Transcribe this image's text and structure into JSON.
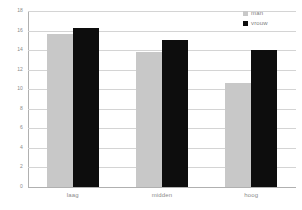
{
  "chart_data": {
    "type": "bar",
    "title": "",
    "xlabel": "",
    "ylabel": "",
    "categories": [
      "laag",
      "midden",
      "hoog"
    ],
    "series": [
      {
        "name": "man",
        "color": "#c8c8c8",
        "values": [
          15.6,
          13.8,
          10.6
        ]
      },
      {
        "name": "vrouw",
        "color": "#0d0d0d",
        "values": [
          16.3,
          15.0,
          14.0
        ]
      }
    ],
    "ylim": [
      0,
      18
    ],
    "yticks": [
      0,
      2,
      4,
      6,
      8,
      10,
      12,
      14,
      16,
      18
    ],
    "ytick_labels": [
      "0",
      "2",
      "4",
      "6",
      "8",
      "10",
      "12",
      "14",
      "16",
      "18"
    ],
    "grid": "horizontal",
    "legend_position": "top-right"
  },
  "legend": {
    "entries": [
      {
        "label": "man",
        "swatch": "man-swatch"
      },
      {
        "label": "vrouw",
        "swatch": "vrouw-swatch"
      }
    ]
  },
  "colors": {
    "man": "#c8c8c8",
    "vrouw": "#0d0d0d",
    "gridline": "#d4d4d4",
    "axis": "#b0b0b0",
    "text": "#8a8a8a",
    "background": "#ffffff"
  }
}
